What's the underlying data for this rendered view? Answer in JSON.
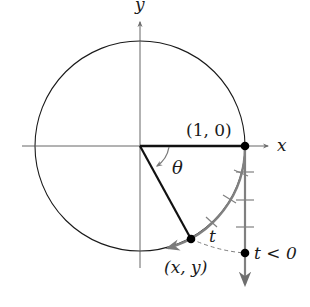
{
  "diagram": {
    "type": "unit-circle-wrapping-function",
    "labels": {
      "x_axis": "x",
      "y_axis": "y",
      "start_point": "(1, 0)",
      "angle": "θ",
      "arc_length": "t",
      "terminal_point": "(x, y)",
      "number_line_point": "t < 0"
    },
    "colors": {
      "circle": "#1a1a1a",
      "axes": "#555555",
      "radius": "#111111",
      "arc": "#808080",
      "number_line": "#808080",
      "points": "#000000",
      "dashed_connector": "#808080"
    },
    "geometry": {
      "center": [
        140,
        146
      ],
      "radius": 105,
      "start_point_xy": [
        245,
        146
      ],
      "terminal_point_xy": [
        191,
        239
      ],
      "number_line_point_xy": [
        245,
        253
      ],
      "number_line_ticks_y": [
        172,
        200,
        227
      ],
      "arc_ticks_count": 3
    }
  }
}
